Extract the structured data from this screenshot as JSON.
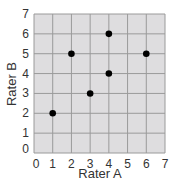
{
  "chart_data": {
    "type": "scatter",
    "title": "",
    "xlabel": "Rater A",
    "ylabel": "Rater B",
    "xlim": [
      0,
      7
    ],
    "ylim": [
      0,
      7
    ],
    "xticks": [
      0,
      1,
      2,
      3,
      4,
      5,
      6,
      7
    ],
    "yticks": [
      0,
      1,
      2,
      3,
      4,
      5,
      6,
      7
    ],
    "grid": true,
    "legend": null,
    "series": [
      {
        "name": "ratings",
        "points": [
          {
            "x": 1,
            "y": 2
          },
          {
            "x": 2,
            "y": 5
          },
          {
            "x": 3,
            "y": 3
          },
          {
            "x": 4,
            "y": 6
          },
          {
            "x": 4,
            "y": 4
          },
          {
            "x": 6,
            "y": 5
          }
        ]
      }
    ]
  },
  "colors": {
    "plot_bg": "#dedddf",
    "grid": "#9a9a9a",
    "point": "#000000",
    "text": "#333333"
  }
}
